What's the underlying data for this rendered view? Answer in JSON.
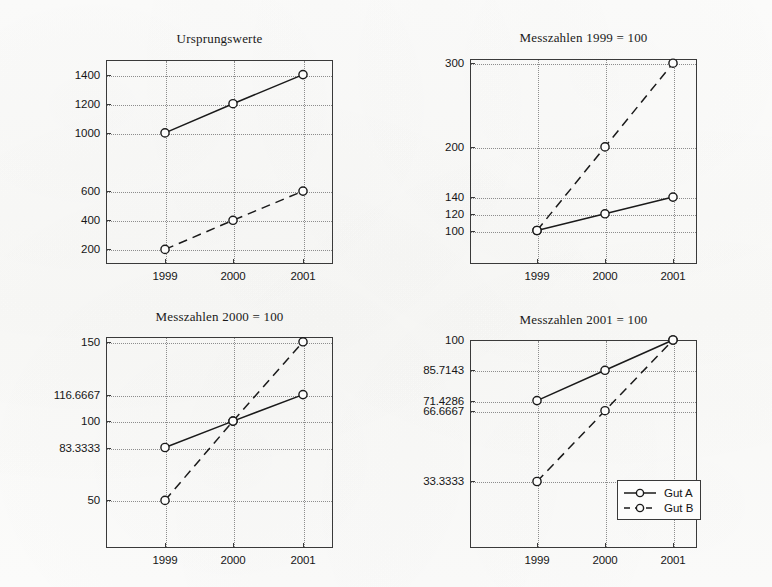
{
  "figure": {
    "background_color": "#fdfdfc",
    "axis_color": "#3a3a3a",
    "grid_color": "#8d8d8d",
    "series_color": "#1a1a1a"
  },
  "legend": {
    "entries": [
      {
        "label": "Gut A",
        "style": "solid",
        "marker": "circle"
      },
      {
        "label": "Gut B",
        "style": "dashed",
        "marker": "circle"
      }
    ]
  },
  "chart_data": [
    {
      "id": "ursprungswerte",
      "type": "line",
      "title": "Ursprungswerte",
      "xlabel": "",
      "ylabel": "",
      "categories": [
        "1999",
        "2000",
        "2001"
      ],
      "x": [
        1999,
        2000,
        2001
      ],
      "ytick_labels": [
        "1400",
        "1200",
        "1000",
        "600",
        "400",
        "200"
      ],
      "ytick_values": [
        1400,
        1200,
        1000,
        600,
        400,
        200
      ],
      "ylim": [
        100,
        1500
      ],
      "grid": true,
      "legend_position": "none",
      "series": [
        {
          "name": "Gut A",
          "style": "solid",
          "values": [
            1000,
            1200,
            1400
          ]
        },
        {
          "name": "Gut B",
          "style": "dashed",
          "values": [
            200,
            400,
            600
          ]
        }
      ]
    },
    {
      "id": "messzahlen-1999",
      "type": "line",
      "title": "Messzahlen 1999 = 100",
      "xlabel": "",
      "ylabel": "",
      "categories": [
        "1999",
        "2000",
        "2001"
      ],
      "x": [
        1999,
        2000,
        2001
      ],
      "ytick_labels": [
        "300",
        "200",
        "140",
        "120",
        "100"
      ],
      "ytick_values": [
        300,
        200,
        140,
        120,
        100
      ],
      "ylim": [
        60,
        305
      ],
      "grid": true,
      "legend_position": "none",
      "series": [
        {
          "name": "Gut A",
          "style": "solid",
          "values": [
            100,
            120,
            140
          ]
        },
        {
          "name": "Gut B",
          "style": "dashed",
          "values": [
            100,
            200,
            300
          ]
        }
      ]
    },
    {
      "id": "messzahlen-2000",
      "type": "line",
      "title": "Messzahlen 2000 = 100",
      "xlabel": "",
      "ylabel": "",
      "categories": [
        "1999",
        "2000",
        "2001"
      ],
      "x": [
        1999,
        2000,
        2001
      ],
      "ytick_labels": [
        "150",
        "116.6667",
        "100",
        "83.3333",
        "50"
      ],
      "ytick_values": [
        150,
        116.6667,
        100,
        83.3333,
        50
      ],
      "ylim": [
        20,
        153
      ],
      "grid": true,
      "legend_position": "none",
      "series": [
        {
          "name": "Gut A",
          "style": "solid",
          "values": [
            83.3333,
            100,
            116.6667
          ]
        },
        {
          "name": "Gut B",
          "style": "dashed",
          "values": [
            50,
            100,
            150
          ]
        }
      ]
    },
    {
      "id": "messzahlen-2001",
      "type": "line",
      "title": "Messzahlen 2001 = 100",
      "xlabel": "",
      "ylabel": "",
      "categories": [
        "1999",
        "2000",
        "2001"
      ],
      "x": [
        1999,
        2000,
        2001
      ],
      "ytick_labels": [
        "100",
        "85.7143",
        "71.4286",
        "66.6667",
        "33.3333"
      ],
      "ytick_values": [
        100,
        85.7143,
        71.4286,
        66.6667,
        33.3333
      ],
      "ylim": [
        2,
        100
      ],
      "grid": true,
      "legend_position": "lower right",
      "series": [
        {
          "name": "Gut A",
          "style": "solid",
          "values": [
            71.4286,
            85.7143,
            100
          ]
        },
        {
          "name": "Gut B",
          "style": "dashed",
          "values": [
            33.3333,
            66.6667,
            100
          ]
        }
      ]
    }
  ]
}
